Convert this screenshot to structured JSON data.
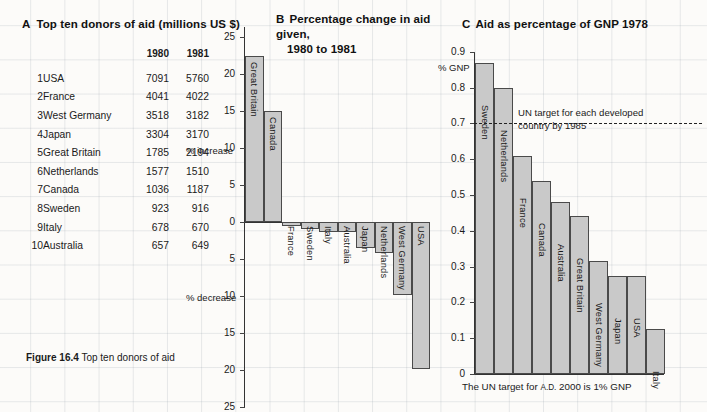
{
  "figure": {
    "caption_bold": "Figure 16.4",
    "caption_text": "Top ten donors of aid"
  },
  "panelA": {
    "letter": "A",
    "title": "Top ten donors of aid (millions US $)",
    "columns": [
      "",
      "",
      "1980",
      "1981"
    ],
    "rows": [
      {
        "rank": "1",
        "name": "USA",
        "y1980": "7091",
        "y1981": "5760"
      },
      {
        "rank": "2",
        "name": "France",
        "y1980": "4041",
        "y1981": "4022"
      },
      {
        "rank": "3",
        "name": "West Germany",
        "y1980": "3518",
        "y1981": "3182"
      },
      {
        "rank": "4",
        "name": "Japan",
        "y1980": "3304",
        "y1981": "3170"
      },
      {
        "rank": "5",
        "name": "Great Britain",
        "y1980": "1785",
        "y1981": "2194"
      },
      {
        "rank": "6",
        "name": "Netherlands",
        "y1980": "1577",
        "y1981": "1510"
      },
      {
        "rank": "7",
        "name": "Canada",
        "y1980": "1036",
        "y1981": "1187"
      },
      {
        "rank": "8",
        "name": "Sweden",
        "y1980": "923",
        "y1981": "916"
      },
      {
        "rank": "9",
        "name": "Italy",
        "y1980": "678",
        "y1981": "670"
      },
      {
        "rank": "10",
        "name": "Australia",
        "y1980": "657",
        "y1981": "649"
      }
    ]
  },
  "panelB": {
    "letter": "B",
    "title_line1": "Percentage change in aid given,",
    "title_line2": "1980 to 1981",
    "label_increase": "% increase",
    "label_decrease": "% decrease"
  },
  "panelC": {
    "letter": "C",
    "title": "Aid as percentage of GNP 1978",
    "axis_label": "% GNP",
    "un_target_line1": "UN target for each developed",
    "un_target_line2": "country by 1985",
    "un_target_value": 0.7,
    "footnote_a": "The UN target for",
    "footnote_sm": "A.D.",
    "footnote_b": "2000 is 1% GNP"
  },
  "chart_data": [
    {
      "type": "bar",
      "id": "panel-b",
      "title": "B Percentage change in aid given, 1980 to 1981",
      "xlabel": "",
      "ylabel": "% increase / % decrease",
      "ylim": [
        -25,
        25
      ],
      "yticks": [
        25,
        20,
        15,
        10,
        5,
        0,
        -5,
        -10,
        -15,
        -20,
        -25
      ],
      "ytick_labels": [
        "25",
        "20",
        "15",
        "10",
        "5",
        "0",
        "5",
        "10",
        "15",
        "20",
        "25"
      ],
      "grid": true,
      "categories": [
        "Great Britain",
        "Canada",
        "France",
        "Sweden",
        "Italy",
        "Australia",
        "Japan",
        "Netherlands",
        "West Germany",
        "USA"
      ],
      "values": [
        22.5,
        15.0,
        -0.6,
        -0.9,
        -1.3,
        -1.3,
        -3.5,
        -4.2,
        -9.8,
        -19.9
      ]
    },
    {
      "type": "bar",
      "id": "panel-c",
      "title": "C Aid as percentage of GNP 1978",
      "xlabel": "",
      "ylabel": "% GNP",
      "ylim": [
        0,
        0.9
      ],
      "yticks": [
        0.9,
        0.8,
        0.7,
        0.6,
        0.5,
        0.4,
        0.3,
        0.2,
        0.1,
        0
      ],
      "ytick_labels": [
        "0.9",
        "0.8",
        "0.7",
        "0.6",
        "0.5",
        "0.4",
        "0.3",
        "0.2",
        "0.1",
        "0"
      ],
      "grid": true,
      "annotations": [
        {
          "type": "hline",
          "value": 0.7,
          "style": "dashed",
          "text": "UN target for each developed country by 1985"
        }
      ],
      "categories": [
        "Sweden",
        "Netherlands",
        "France",
        "Canada",
        "Australia",
        "Great Britain",
        "West Germany",
        "Japan",
        "USA",
        "Italy"
      ],
      "values": [
        0.87,
        0.8,
        0.61,
        0.54,
        0.48,
        0.44,
        0.315,
        0.275,
        0.275,
        0.125
      ]
    },
    {
      "type": "table",
      "id": "panel-a",
      "title": "A Top ten donors of aid (millions US $)",
      "columns": [
        "rank",
        "country",
        "1980",
        "1981"
      ],
      "rows": [
        [
          "1",
          "USA",
          7091,
          5760
        ],
        [
          "2",
          "France",
          4041,
          4022
        ],
        [
          "3",
          "West Germany",
          3518,
          3182
        ],
        [
          "4",
          "Japan",
          3304,
          3170
        ],
        [
          "5",
          "Great Britain",
          1785,
          2194
        ],
        [
          "6",
          "Netherlands",
          1577,
          1510
        ],
        [
          "7",
          "Canada",
          1036,
          1187
        ],
        [
          "8",
          "Sweden",
          923,
          916
        ],
        [
          "9",
          "Italy",
          678,
          670
        ],
        [
          "10",
          "Australia",
          657,
          649
        ]
      ]
    }
  ],
  "colors": {
    "bar_fill": "#c9c9c9",
    "bar_stroke": "#4a4a4a",
    "grid": "#96a0aa",
    "text": "#1a1a1a"
  }
}
